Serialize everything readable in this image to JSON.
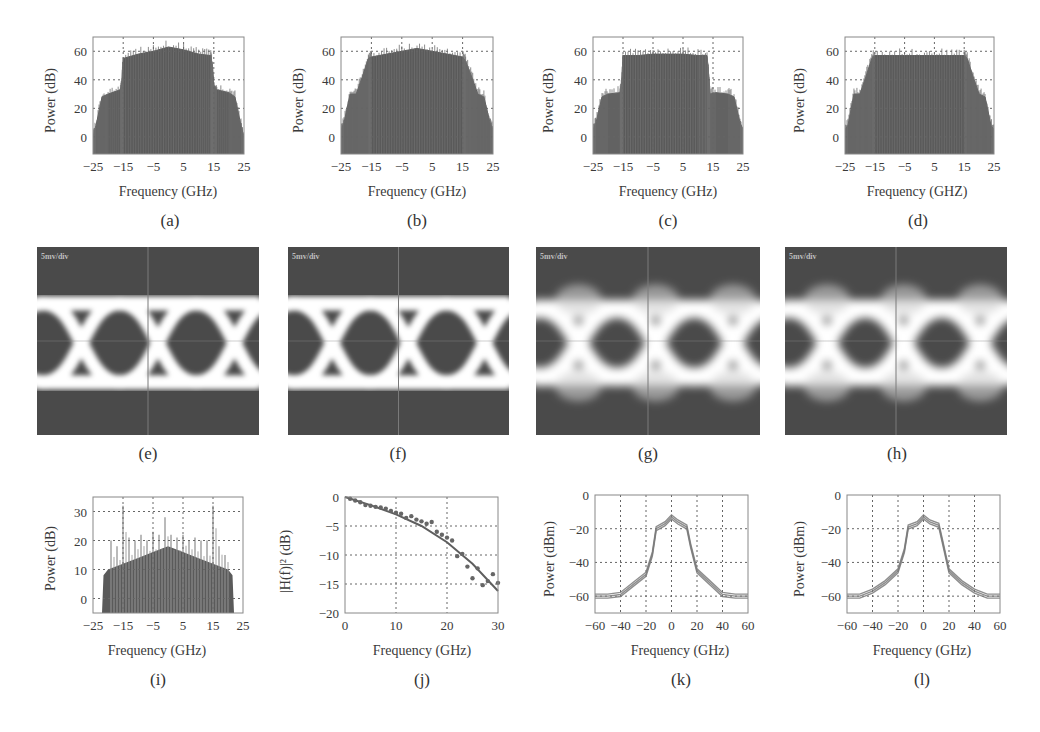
{
  "figure": {
    "panels": [
      {
        "id": "a",
        "label": "(a)",
        "xlabel": "Frequency (GHz)",
        "ylabel": "Power (dB)"
      },
      {
        "id": "b",
        "label": "(b)",
        "xlabel": "Frequency (GHz)",
        "ylabel": "Power (dB)"
      },
      {
        "id": "c",
        "label": "(c)",
        "xlabel": "Frequency (GHz)",
        "ylabel": "Power (dB)"
      },
      {
        "id": "d",
        "label": "(d)",
        "xlabel": "Frequency (GHZ)",
        "ylabel": "Power (dB)"
      },
      {
        "id": "e",
        "label": "(e)",
        "scope_label": "5mv/div"
      },
      {
        "id": "f",
        "label": "(f)",
        "scope_label": "5mv/div"
      },
      {
        "id": "g",
        "label": "(g)",
        "scope_label": "5mv/div"
      },
      {
        "id": "h",
        "label": "(h)",
        "scope_label": "5mv/div"
      },
      {
        "id": "i",
        "label": "(i)",
        "xlabel": "Frequency (GHz)",
        "ylabel": "Power (dB)"
      },
      {
        "id": "j",
        "label": "(j)",
        "xlabel": "Frequency (GHz)",
        "ylabel": "|H(f)|² (dB)"
      },
      {
        "id": "k",
        "label": "(k)",
        "xlabel": "Frequency (GHz)",
        "ylabel": "Power (dBm)"
      },
      {
        "id": "l",
        "label": "(l)",
        "xlabel": "Frequency (GHz)",
        "ylabel": "Power (dBm)"
      }
    ]
  },
  "colors": {
    "fill": "#5a5a5a",
    "curve": "#7a7a7a",
    "grid": "#666666",
    "frame": "#888888",
    "eye_bg": "#4a4a4a",
    "eye_trace": "#ffffff"
  },
  "chart_data": [
    {
      "id": "a",
      "type": "area",
      "title": "(a)",
      "xlabel": "Frequency (GHz)",
      "ylabel": "Power (dB)",
      "xlim": [
        -25,
        25
      ],
      "ylim": [
        -12,
        70
      ],
      "xticks": [
        -25,
        -15,
        -5,
        5,
        15,
        25
      ],
      "yticks": [
        0,
        20,
        40,
        60
      ],
      "grid": true,
      "x": [
        -25,
        -24,
        -22,
        -20,
        -16,
        -15.5,
        -15,
        -10,
        -5,
        0,
        5,
        10,
        14,
        14.5,
        15,
        16,
        20,
        22,
        24,
        25
      ],
      "values": [
        0,
        8,
        28,
        30,
        33,
        36,
        55,
        58,
        60,
        63,
        61,
        58,
        57,
        50,
        36,
        33,
        31,
        28,
        8,
        0
      ]
    },
    {
      "id": "b",
      "type": "area",
      "title": "(b)",
      "xlabel": "Frequency (GHz)",
      "ylabel": "Power (dB)",
      "xlim": [
        -25,
        25
      ],
      "ylim": [
        -12,
        70
      ],
      "xticks": [
        -25,
        -15,
        -5,
        5,
        15,
        25
      ],
      "yticks": [
        0,
        20,
        40,
        60
      ],
      "grid": true,
      "x": [
        -25,
        -24,
        -22,
        -20,
        -18,
        -16,
        -15,
        -10,
        -5,
        0,
        5,
        10,
        15,
        16,
        18,
        20,
        22,
        24,
        25
      ],
      "values": [
        5,
        10,
        30,
        30,
        42,
        55,
        56,
        58,
        60,
        62,
        60,
        58,
        56,
        53,
        42,
        30,
        28,
        10,
        5
      ]
    },
    {
      "id": "c",
      "type": "area",
      "title": "(c)",
      "xlabel": "Frequency (GHz)",
      "ylabel": "Power (dB)",
      "xlim": [
        -25,
        25
      ],
      "ylim": [
        -12,
        70
      ],
      "xticks": [
        -25,
        -15,
        -5,
        5,
        15,
        25
      ],
      "yticks": [
        0,
        20,
        40,
        60
      ],
      "grid": true,
      "x": [
        -25,
        -24,
        -22,
        -20,
        -16,
        -15.5,
        -15,
        -10,
        -5,
        0,
        5,
        10,
        13,
        13.5,
        14,
        16,
        20,
        22,
        24,
        25
      ],
      "values": [
        5,
        10,
        28,
        30,
        31,
        36,
        57,
        57,
        58,
        58,
        58,
        57,
        57,
        45,
        30,
        31,
        30,
        28,
        10,
        5
      ]
    },
    {
      "id": "d",
      "type": "area",
      "title": "(d)",
      "xlabel": "Frequency (GHZ)",
      "ylabel": "Power (dB)",
      "xlim": [
        -25,
        25
      ],
      "ylim": [
        -12,
        70
      ],
      "xticks": [
        -25,
        -15,
        -5,
        5,
        15,
        25
      ],
      "yticks": [
        0,
        20,
        40,
        60
      ],
      "grid": true,
      "x": [
        -25,
        -24,
        -22,
        -20,
        -18,
        -16,
        -15,
        -10,
        -5,
        0,
        5,
        10,
        15,
        16,
        18,
        20,
        22,
        24,
        25
      ],
      "values": [
        5,
        8,
        30,
        30,
        42,
        55,
        57,
        57,
        57,
        57,
        57,
        57,
        57,
        55,
        42,
        30,
        28,
        8,
        5
      ]
    },
    {
      "id": "i",
      "type": "bar",
      "title": "(i)",
      "xlabel": "Frequency (GHz)",
      "ylabel": "Power (dB)",
      "xlim": [
        -25,
        25
      ],
      "ylim": [
        -5,
        35
      ],
      "xticks": [
        -25,
        -15,
        -5,
        5,
        15,
        25
      ],
      "yticks": [
        0,
        10,
        20,
        30
      ],
      "grid": true,
      "envelope_x": [
        -25,
        -22,
        -21.5,
        -20,
        -15,
        -10,
        -5,
        0,
        5,
        10,
        15,
        20,
        21.5,
        22,
        25
      ],
      "envelope_values": [
        -5,
        -5,
        8,
        10,
        12,
        14,
        16,
        18,
        16,
        14,
        12,
        10,
        8,
        -5,
        -5
      ],
      "spikes_x": [
        -19,
        -17,
        -15,
        -13,
        -11,
        -9,
        -7,
        -5,
        -3,
        -1,
        1,
        3,
        5,
        7,
        9,
        11,
        13,
        15,
        17,
        19
      ],
      "spikes_values": [
        20,
        18,
        32,
        21,
        20,
        22,
        20,
        23,
        22,
        28,
        22,
        21,
        22,
        20,
        21,
        20,
        20,
        32,
        18,
        15
      ]
    },
    {
      "id": "j",
      "type": "scatter",
      "title": "(j)",
      "xlabel": "Frequency (GHz)",
      "ylabel": "|H(f)|² (dB)",
      "xlim": [
        0,
        30
      ],
      "ylim": [
        -20,
        0
      ],
      "xticks": [
        0,
        10,
        20,
        30
      ],
      "yticks": [
        0,
        -5,
        -10,
        -15,
        -20
      ],
      "grid": true,
      "series": [
        {
          "name": "measured",
          "x": [
            1,
            2,
            3,
            4,
            5,
            6,
            7,
            8,
            9,
            10,
            11,
            12,
            13,
            14,
            15,
            16,
            17,
            18,
            19,
            20,
            21,
            22,
            23,
            24,
            25,
            26,
            27,
            28,
            29,
            30
          ],
          "values": [
            -0.3,
            -0.6,
            -0.9,
            -1.4,
            -1.5,
            -1.7,
            -1.8,
            -2.0,
            -2.4,
            -2.7,
            -2.9,
            -3.6,
            -3.3,
            -3.9,
            -4.2,
            -4.6,
            -4.3,
            -6.0,
            -6.5,
            -7.0,
            -7.5,
            -10.2,
            -9.8,
            -12.0,
            -14.0,
            -12.3,
            -15.2,
            -14.5,
            -13.3,
            -14.8
          ]
        },
        {
          "name": "fit",
          "x": [
            0,
            5,
            10,
            15,
            20,
            25,
            30
          ],
          "values": [
            0,
            -1.4,
            -3.0,
            -5.0,
            -7.8,
            -11.5,
            -16.2
          ]
        }
      ]
    },
    {
      "id": "k",
      "type": "line",
      "title": "(k)",
      "xlabel": "Frequency (GHz)",
      "ylabel": "Power (dBm)",
      "xlim": [
        -60,
        60
      ],
      "ylim": [
        -70,
        0
      ],
      "xticks": [
        -60,
        -40,
        -20,
        0,
        20,
        40,
        60
      ],
      "yticks": [
        0,
        -20,
        -40,
        -60
      ],
      "grid": true,
      "x": [
        -60,
        -50,
        -40,
        -30,
        -20,
        -15,
        -12,
        -5,
        0,
        5,
        12,
        15,
        20,
        30,
        40,
        50,
        60
      ],
      "values": [
        -60,
        -60,
        -59,
        -53,
        -47,
        -35,
        -20,
        -17,
        -13,
        -16,
        -19,
        -30,
        -45,
        -52,
        -59,
        -60,
        -60
      ]
    },
    {
      "id": "l",
      "type": "line",
      "title": "(l)",
      "xlabel": "Frequency (GHz)",
      "ylabel": "Power (dBm)",
      "xlim": [
        -60,
        60
      ],
      "ylim": [
        -70,
        0
      ],
      "xticks": [
        -60,
        -40,
        -20,
        0,
        20,
        40,
        60
      ],
      "yticks": [
        0,
        -20,
        -40,
        -60
      ],
      "grid": true,
      "x": [
        -60,
        -50,
        -40,
        -30,
        -20,
        -15,
        -12,
        -5,
        0,
        5,
        12,
        15,
        20,
        30,
        40,
        50,
        60
      ],
      "values": [
        -60,
        -60,
        -57,
        -52,
        -45,
        -33,
        -19,
        -17,
        -13,
        -16,
        -18,
        -28,
        -45,
        -52,
        -57,
        -60,
        -60
      ]
    }
  ]
}
